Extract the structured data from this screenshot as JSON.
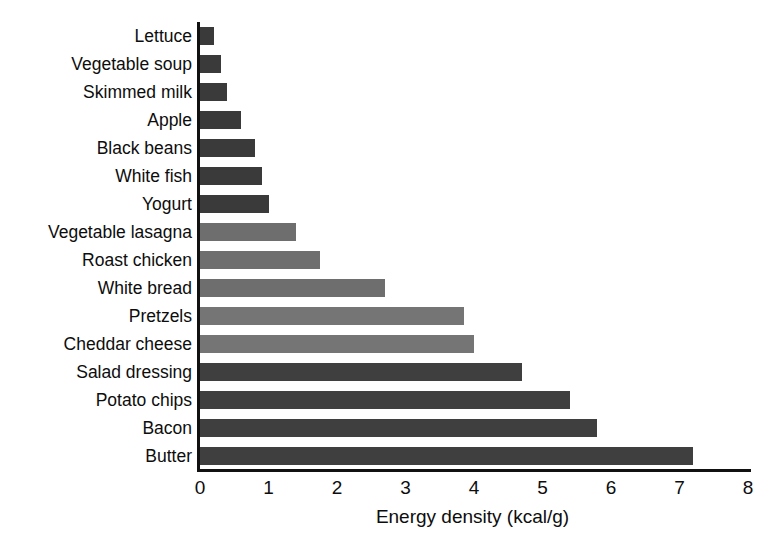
{
  "chart_data": {
    "type": "bar",
    "orientation": "horizontal",
    "title": "",
    "xlabel": "Energy density (kcal/g)",
    "ylabel": "",
    "xlim": [
      0,
      8
    ],
    "xticks": [
      "0",
      "1",
      "2",
      "3",
      "4",
      "5",
      "6",
      "7",
      "8"
    ],
    "grid": false,
    "legend": false,
    "categories": [
      "Lettuce",
      "Vegetable soup",
      "Skimmed milk",
      "Apple",
      "Black beans",
      "White fish",
      "Yogurt",
      "Vegetable lasagna",
      "Roast chicken",
      "White bread",
      "Pretzels",
      "Cheddar cheese",
      "Salad dressing",
      "Potato chips",
      "Bacon",
      "Butter"
    ],
    "values": [
      0.2,
      0.3,
      0.4,
      0.6,
      0.8,
      0.9,
      1.0,
      1.4,
      1.75,
      2.7,
      3.85,
      4.0,
      4.7,
      5.4,
      5.8,
      7.2
    ],
    "bar_colors": [
      "#3a3a3a",
      "#3a3a3a",
      "#3a3a3a",
      "#3a3a3a",
      "#3a3a3a",
      "#3a3a3a",
      "#3a3a3a",
      "#6e6e6e",
      "#6e6e6e",
      "#6e6e6e",
      "#757575",
      "#757575",
      "#3f3f3f",
      "#3f3f3f",
      "#3f3f3f",
      "#3f3f3f"
    ],
    "axis_color": "#111111"
  }
}
